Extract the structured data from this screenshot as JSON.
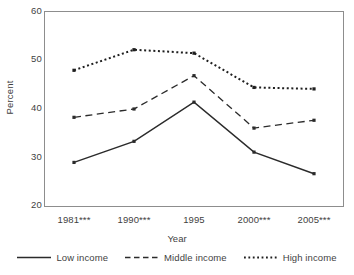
{
  "chart_data": {
    "type": "line",
    "title": "",
    "xlabel": "Year",
    "ylabel": "Percent",
    "categories": [
      "1981***",
      "1990***",
      "1995",
      "2000***",
      "2005***"
    ],
    "ylim": [
      20,
      60
    ],
    "yticks": [
      60,
      50,
      40,
      30,
      20
    ],
    "grid": false,
    "legend_position": "bottom",
    "series": [
      {
        "name": "Low income",
        "style": "solid",
        "color": "#2b2b2b",
        "marker": "square",
        "values": [
          29.1,
          33.4,
          41.4,
          31.2,
          26.8
        ]
      },
      {
        "name": "Middle income",
        "style": "dashed",
        "color": "#2b2b2b",
        "marker": "square",
        "values": [
          38.3,
          40.0,
          46.8,
          36.1,
          37.7
        ]
      },
      {
        "name": "High income",
        "style": "dotted",
        "color": "#1f1f1f",
        "marker": "square",
        "values": [
          47.9,
          52.1,
          51.4,
          44.4,
          44.1
        ]
      }
    ]
  },
  "axes": {
    "y_title": "Percent",
    "x_title": "Year",
    "y_tick_labels": [
      "60",
      "50",
      "40",
      "30",
      "20"
    ],
    "x_tick_labels": [
      "1981***",
      "1990***",
      "1995",
      "2000***",
      "2005***"
    ]
  },
  "legend": {
    "items": [
      {
        "label": "Low income",
        "style": "solid"
      },
      {
        "label": "Middle income",
        "style": "dashed"
      },
      {
        "label": "High income",
        "style": "dotted"
      }
    ]
  },
  "colors": {
    "frame": "#8d8d8d",
    "text": "#3f3f3f",
    "line": "#2b2b2b",
    "background": "#ffffff"
  }
}
